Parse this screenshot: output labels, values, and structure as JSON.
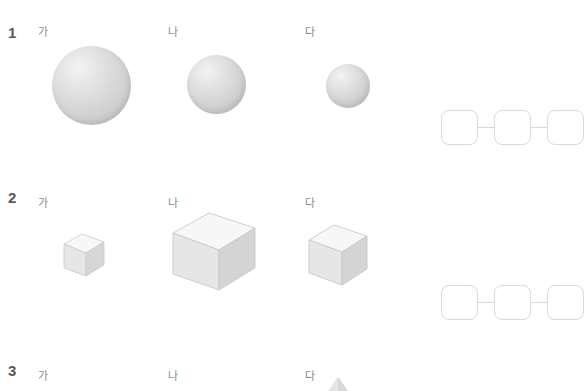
{
  "page": {
    "background": "#ffffff",
    "width": 584,
    "height": 390
  },
  "palette": {
    "row_number_color": "#58595b",
    "label_color": "#8a8c8e",
    "box_border_color": "#d9dadb",
    "sphere_light": "#f3f3f3",
    "sphere_mid": "#d8d8d8",
    "sphere_dark": "#c2c2c2",
    "cube_top": "#f7f7f7",
    "cube_left": "#e3e3e3",
    "cube_right": "#d2d2d2",
    "cube_stroke": "#c9c9c9"
  },
  "rows": [
    {
      "number": "1",
      "shape_type": "sphere",
      "items": [
        {
          "label": "가",
          "size": "large"
        },
        {
          "label": "나",
          "size": "medium"
        },
        {
          "label": "다",
          "size": "small"
        }
      ],
      "chain": {
        "box_count": 3,
        "visible_boxes": 3,
        "clipped_right": true
      }
    },
    {
      "number": "2",
      "shape_type": "cube",
      "items": [
        {
          "label": "가",
          "size": "small"
        },
        {
          "label": "나",
          "size": "large"
        },
        {
          "label": "다",
          "size": "medium"
        }
      ],
      "chain": {
        "box_count": 3,
        "visible_boxes": 3,
        "clipped_right": true
      }
    },
    {
      "number": "3",
      "shape_type": "cone",
      "items": [
        {
          "label": "가",
          "size": "unknown"
        },
        {
          "label": "나",
          "size": "unknown"
        },
        {
          "label": "다",
          "size": "unknown"
        }
      ],
      "chain": null,
      "clipped_bottom": true
    }
  ]
}
